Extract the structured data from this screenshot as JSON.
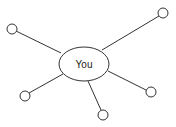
{
  "diagram": {
    "type": "star-network",
    "center": {
      "label": "You",
      "cx": 84,
      "cy": 64,
      "rx": 25,
      "ry": 17
    },
    "nodes": [
      {
        "id": "top-left",
        "cx": 12,
        "cy": 29,
        "r": 5
      },
      {
        "id": "top-right",
        "cx": 163,
        "cy": 13,
        "r": 5
      },
      {
        "id": "bottom-left",
        "cx": 25,
        "cy": 96,
        "r": 5
      },
      {
        "id": "bottom",
        "cx": 103,
        "cy": 115,
        "r": 5
      },
      {
        "id": "right",
        "cx": 151,
        "cy": 92,
        "r": 5
      }
    ],
    "edges": [
      {
        "from": "center",
        "to": "top-left",
        "x1": 61,
        "y1": 53,
        "x2": 16,
        "y2": 31
      },
      {
        "from": "center",
        "to": "top-right",
        "x1": 102,
        "y1": 50,
        "x2": 159,
        "y2": 16
      },
      {
        "from": "center",
        "to": "bottom-left",
        "x1": 63,
        "y1": 74,
        "x2": 29,
        "y2": 93
      },
      {
        "from": "center",
        "to": "bottom",
        "x1": 88,
        "y1": 81,
        "x2": 101,
        "y2": 110
      },
      {
        "from": "center",
        "to": "right",
        "x1": 108,
        "y1": 71,
        "x2": 146,
        "y2": 90
      }
    ],
    "stroke_color": "#333333",
    "fill_color": "#ffffff"
  }
}
